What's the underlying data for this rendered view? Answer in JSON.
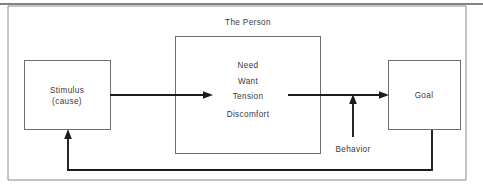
{
  "diagram": {
    "title_label": "The Person",
    "boxes": {
      "stimulus": {
        "line1": "Stimulus",
        "line2": "(cause)"
      },
      "person": {
        "items": [
          "Need",
          "Want",
          "Tension",
          "Discomfort"
        ]
      },
      "goal": {
        "label": "Goal"
      }
    },
    "annotations": {
      "behavior": "Behavior"
    },
    "colors": {
      "box_stroke": "#6e6e6e",
      "frame_stroke": "#8a8a8a",
      "flow_line": "#1c1c1c",
      "text": "#3a3a3a",
      "background": "#ffffff"
    }
  }
}
